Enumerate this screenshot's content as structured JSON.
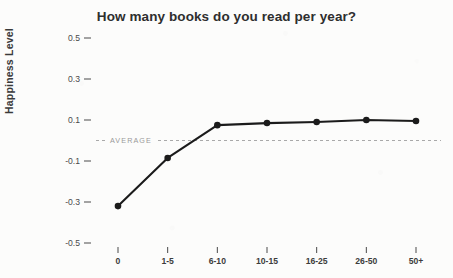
{
  "chart_data": {
    "type": "line",
    "title": "How many books do you read per year?",
    "xlabel": "",
    "ylabel": "Happiness Level",
    "categories": [
      "0",
      "1-5",
      "6-10",
      "10-15",
      "16-25",
      "26-50",
      "50+"
    ],
    "values": [
      -0.32,
      -0.085,
      0.075,
      0.085,
      0.09,
      0.1,
      0.095
    ],
    "series": [
      {
        "name": "Happiness Level",
        "values": [
          -0.32,
          -0.085,
          0.075,
          0.085,
          0.09,
          0.1,
          0.095
        ]
      }
    ],
    "ylim": [
      -0.6,
      0.6
    ],
    "yticks": [
      0.5,
      0.3,
      0.1,
      -0.1,
      -0.3,
      -0.5
    ],
    "ytick_labels": [
      "0.5",
      "0.3",
      "0.1",
      "-0.1",
      "-0.3",
      "-0.5"
    ],
    "grid": false,
    "legend": "none",
    "annotations": [
      {
        "name": "average-reference-line",
        "label": "AVERAGE",
        "value": 0.0,
        "style": "dashed-horizontal",
        "color": "#a9a9a9"
      }
    ],
    "colors": {
      "line": "#1b1b1b",
      "marker": "#1b1b1b",
      "background": "#fcfcfb",
      "title": "#2e2e2e",
      "axis_text": "#4a4a4a",
      "average": "#a9a9a9"
    }
  }
}
